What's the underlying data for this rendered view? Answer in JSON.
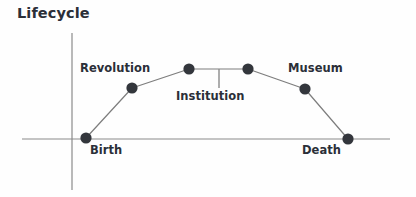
{
  "title": "Lifecycle",
  "colors": {
    "background": "#fefefe",
    "axis": "#8a8a8a",
    "line": "#7d7d7d",
    "marker": "#33363c",
    "text": "#2b2f38",
    "leader": "#8a8a8a"
  },
  "axes": {
    "x_axis": {
      "x1": 22,
      "y1": 139,
      "x2": 390,
      "y2": 139
    },
    "y_axis": {
      "x1": 72,
      "y1": 33,
      "x2": 72,
      "y2": 190
    }
  },
  "labels": {
    "revolution": "Revolution",
    "institution": "Institution",
    "museum": "Museum",
    "birth": "Birth",
    "death": "Death"
  },
  "leader_line": {
    "x": 219,
    "y_top": 69,
    "y_bottom": 88
  },
  "chart_data": {
    "type": "line",
    "title": "Lifecycle",
    "xlabel": "",
    "ylabel": "",
    "grid": false,
    "legend": "none",
    "note": "Conceptual lifecycle curve: rises from Birth through Revolution to a plateau (Institution), then declines through Museum to Death.",
    "categories": [
      "Birth",
      "Revolution",
      "Institution",
      "Institution",
      "Museum",
      "Death"
    ],
    "points": [
      {
        "name": "Birth",
        "px": 86,
        "py": 138,
        "x": 0,
        "y": 0
      },
      {
        "name": "Revolution",
        "px": 132,
        "py": 88,
        "x": 1,
        "y": 3.6
      },
      {
        "name": "Institution",
        "px": 189,
        "py": 69,
        "x": 2,
        "y": 5.0
      },
      {
        "name": "Institution",
        "px": 248,
        "py": 69,
        "x": 3,
        "y": 5.0
      },
      {
        "name": "Museum",
        "px": 305,
        "py": 89,
        "x": 4,
        "y": 3.6
      },
      {
        "name": "Death",
        "px": 348,
        "py": 139,
        "x": 5,
        "y": 0
      }
    ],
    "x": [
      0,
      1,
      2,
      3,
      4,
      5
    ],
    "values": [
      0,
      3.6,
      5.0,
      5.0,
      3.6,
      0
    ],
    "xlim": [
      -0.4,
      5.6
    ],
    "ylim": [
      0,
      6
    ]
  }
}
